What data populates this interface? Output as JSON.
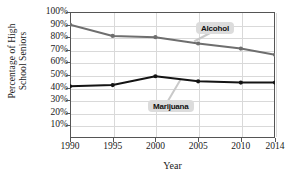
{
  "chart_data": {
    "type": "line",
    "title": "",
    "xlabel": "Year",
    "ylabel": "Percentage of High\nSchool Seniors",
    "x": [
      1990,
      1995,
      2000,
      2005,
      2010,
      2014
    ],
    "xticklabels": [
      "1990",
      "1995",
      "2000",
      "2005",
      "2010",
      "2014"
    ],
    "yticklabels": [
      "100%",
      "90%",
      "80%",
      "70%",
      "60%",
      "50%",
      "40%",
      "30%",
      "20%",
      "10%"
    ],
    "ytickvalues": [
      100,
      90,
      80,
      70,
      60,
      50,
      40,
      30,
      20,
      10
    ],
    "ylim": [
      0,
      100
    ],
    "xlim": [
      1990,
      2014
    ],
    "grid": true,
    "legend_position": "inline-callout",
    "series": [
      {
        "name": "Alcohol",
        "label": "Alcohol",
        "color": "#6e6e6e",
        "values": [
          90,
          81,
          80,
          75,
          71,
          66
        ]
      },
      {
        "name": "Marijuana",
        "label": "Marijuana",
        "color": "#141414",
        "values": [
          41,
          42,
          49,
          45,
          44,
          44
        ]
      }
    ]
  }
}
